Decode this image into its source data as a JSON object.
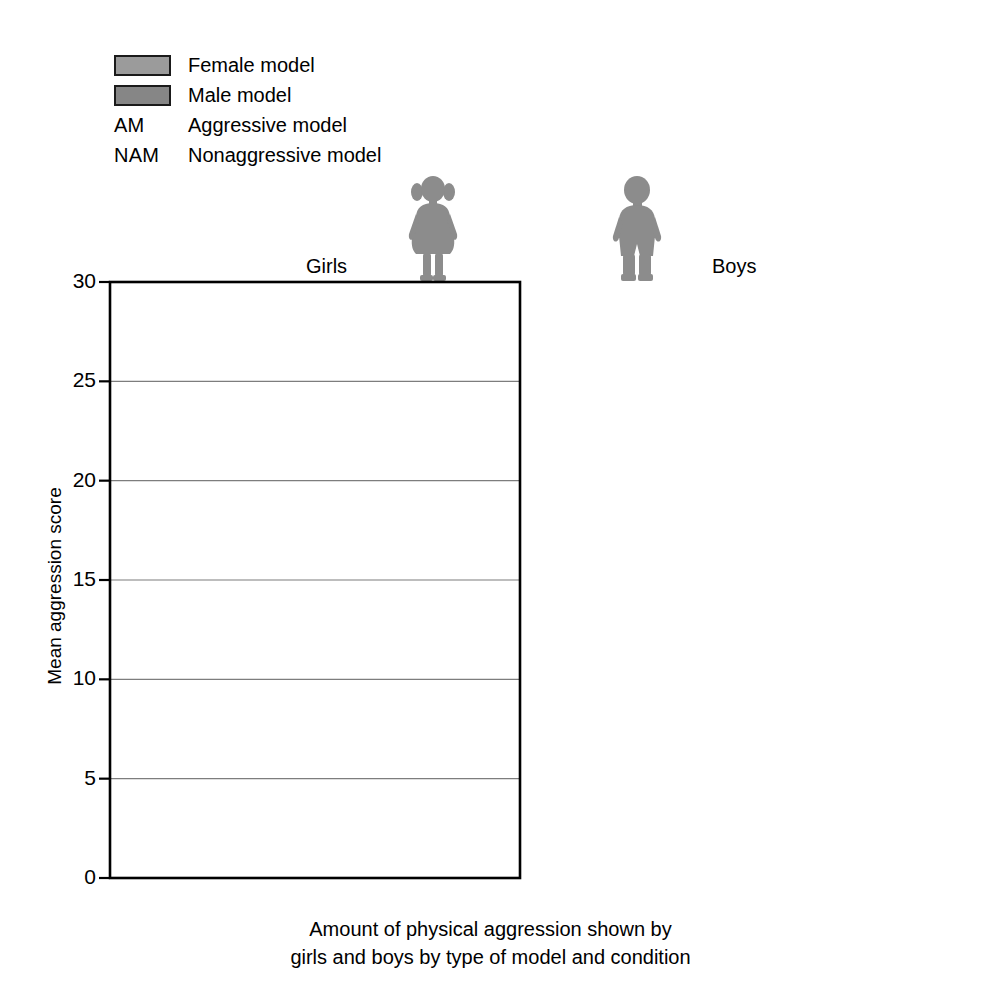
{
  "chart_data": {
    "type": "bar",
    "title": "",
    "caption_line1": "Amount of physical aggression shown by",
    "caption_line2": "girls and boys by type of model and condition",
    "xlabel": "",
    "ylabel": "Mean aggression score",
    "ylim": [
      0,
      30
    ],
    "ytick_step": 5,
    "yticks": [
      0,
      5,
      10,
      15,
      20,
      25,
      30
    ],
    "grid": "horizontal",
    "legend_position": "top-left",
    "categories": [
      "AM",
      "NAM"
    ],
    "category_names": {
      "AM": "Aggressive model",
      "NAM": "Nonaggressive model"
    },
    "panels": [
      {
        "name": "Girls",
        "icon": "girl-silhouette",
        "series": [
          {
            "name": "Female model",
            "values": [
              5.5,
              2.6
            ]
          },
          {
            "name": "Male model",
            "values": [
              7.3,
              0.3
            ]
          }
        ]
      },
      {
        "name": "Boys",
        "icon": "boy-silhouette",
        "series": [
          {
            "name": "Female model",
            "values": [
              12.7,
              0.4
            ]
          },
          {
            "name": "Male model",
            "values": [
              26.1,
              1.9
            ]
          }
        ]
      }
    ],
    "series_colors": {
      "Female model": "#9b9b9b",
      "Male model": "#868686"
    }
  },
  "legend": {
    "items": [
      {
        "kind": "swatch",
        "abbr": "",
        "label": "Female model",
        "color": "#9b9b9b"
      },
      {
        "kind": "swatch",
        "abbr": "",
        "label": "Male model",
        "color": "#868686"
      },
      {
        "kind": "abbr",
        "abbr": "AM",
        "label": "Aggressive model"
      },
      {
        "kind": "abbr",
        "abbr": "NAM",
        "label": "Nonaggressive model"
      }
    ]
  },
  "colors": {
    "axis": "#000000",
    "grid": "#7d7d7d",
    "bar_border": "#1a1a1a",
    "silhouette": "#8c8c8c",
    "background": "#ffffff"
  }
}
